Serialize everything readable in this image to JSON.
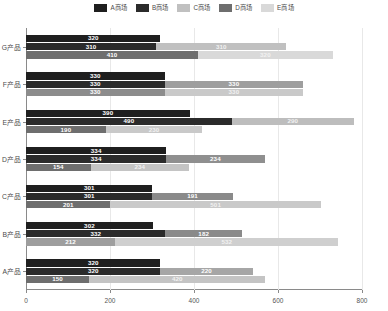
{
  "legend": {
    "position": "top-center",
    "items": [
      {
        "label": "A商场",
        "color": "#1f1f1f"
      },
      {
        "label": "B商场",
        "color": "#2b2b2b"
      },
      {
        "label": "C商场",
        "color": "#c0c0c0"
      },
      {
        "label": "D商场",
        "color": "#6e6e6e"
      },
      {
        "label": "E商场",
        "color": "#d9d9d9"
      }
    ]
  },
  "chart_data": {
    "type": "bar",
    "orientation": "horizontal",
    "stacked": true,
    "title": "",
    "xlabel": "",
    "ylabel": "",
    "xlim": [
      0,
      800
    ],
    "xticks": [
      0,
      200,
      400,
      600,
      800
    ],
    "grid": true,
    "categories": [
      "A产品",
      "B产品",
      "C产品",
      "D产品",
      "E产品",
      "F产品",
      "G产品"
    ],
    "series": [
      {
        "name": "A商场",
        "color": "#1f1f1f",
        "values": [
          320,
          302,
          301,
          334,
          390,
          330,
          320
        ]
      },
      {
        "name": "B商场",
        "color": "#2b2b2b",
        "values": [
          320,
          332,
          301,
          334,
          490,
          330,
          310
        ]
      },
      {
        "name": "C商场",
        "color": "#c0c0c0",
        "values": [
          220,
          182,
          191,
          234,
          290,
          330,
          310
        ]
      },
      {
        "name": "D商场",
        "color": "#6e6e6e",
        "values": [
          150,
          212,
          201,
          154,
          190,
          330,
          410
        ]
      },
      {
        "name": "E商场",
        "color": "#d9d9d9",
        "values": [
          420,
          532,
          501,
          234,
          230,
          330,
          320
        ]
      }
    ],
    "rows": [
      {
        "category": "G产品",
        "bars": [
          {
            "segments": [
              {
                "series": "A商场",
                "value": 320,
                "color": "#1f1f1f",
                "label": "320"
              }
            ]
          },
          {
            "segments": [
              {
                "series": "B商场",
                "value": 310,
                "color": "#2b2b2b",
                "label": "310"
              },
              {
                "series": "C商场",
                "value": 310,
                "color": "#c0c0c0",
                "label": "310"
              }
            ]
          },
          {
            "segments": [
              {
                "series": "D商场",
                "value": 410,
                "color": "#6e6e6e",
                "label": "410"
              },
              {
                "series": "E商场",
                "value": 320,
                "color": "#d9d9d9",
                "label": "320"
              }
            ]
          }
        ]
      },
      {
        "category": "F产品",
        "bars": [
          {
            "segments": [
              {
                "series": "A商场",
                "value": 330,
                "color": "#1f1f1f",
                "label": "330"
              }
            ]
          },
          {
            "segments": [
              {
                "series": "B商场",
                "value": 330,
                "color": "#2b2b2b",
                "label": "330"
              },
              {
                "series": "C商场",
                "value": 330,
                "color": "#9e9e9e",
                "label": "330"
              }
            ]
          },
          {
            "segments": [
              {
                "series": "D商场",
                "value": 330,
                "color": "#8c8c8c",
                "label": "330"
              },
              {
                "series": "E商场",
                "value": 330,
                "color": "#c9c9c9",
                "label": "330"
              }
            ]
          }
        ]
      },
      {
        "category": "E产品",
        "bars": [
          {
            "segments": [
              {
                "series": "A商场",
                "value": 390,
                "color": "#1f1f1f",
                "label": "390"
              }
            ]
          },
          {
            "segments": [
              {
                "series": "B商场",
                "value": 490,
                "color": "#2b2b2b",
                "label": "490"
              },
              {
                "series": "C商场",
                "value": 290,
                "color": "#bdbdbd",
                "label": "290"
              }
            ]
          },
          {
            "segments": [
              {
                "series": "D商场",
                "value": 190,
                "color": "#6e6e6e",
                "label": "190"
              },
              {
                "series": "E商场",
                "value": 230,
                "color": "#c9c9c9",
                "label": "230"
              }
            ]
          }
        ]
      },
      {
        "category": "D产品",
        "bars": [
          {
            "segments": [
              {
                "series": "A商场",
                "value": 334,
                "color": "#1f1f1f",
                "label": "334"
              }
            ]
          },
          {
            "segments": [
              {
                "series": "B商场",
                "value": 334,
                "color": "#2b2b2b",
                "label": "334"
              },
              {
                "series": "C商场",
                "value": 234,
                "color": "#8f8f8f",
                "label": "234"
              }
            ]
          },
          {
            "segments": [
              {
                "series": "D商场",
                "value": 154,
                "color": "#6e6e6e",
                "label": "154"
              },
              {
                "series": "E商场",
                "value": 234,
                "color": "#c4c4c4",
                "label": "234"
              }
            ]
          }
        ]
      },
      {
        "category": "C产品",
        "bars": [
          {
            "segments": [
              {
                "series": "A商场",
                "value": 301,
                "color": "#1f1f1f",
                "label": "301"
              }
            ]
          },
          {
            "segments": [
              {
                "series": "B商场",
                "value": 301,
                "color": "#2b2b2b",
                "label": "301"
              },
              {
                "series": "C商场",
                "value": 191,
                "color": "#8a8a8a",
                "label": "191"
              }
            ]
          },
          {
            "segments": [
              {
                "series": "D商场",
                "value": 201,
                "color": "#6e6e6e",
                "label": "201"
              },
              {
                "series": "E商场",
                "value": 501,
                "color": "#c9c9c9",
                "label": "501"
              }
            ]
          }
        ]
      },
      {
        "category": "B产品",
        "bars": [
          {
            "segments": [
              {
                "series": "A商场",
                "value": 302,
                "color": "#1f1f1f",
                "label": "302"
              }
            ]
          },
          {
            "segments": [
              {
                "series": "B商场",
                "value": 332,
                "color": "#2b2b2b",
                "label": "332"
              },
              {
                "series": "C商场",
                "value": 182,
                "color": "#8a8a8a",
                "label": "182"
              }
            ]
          },
          {
            "segments": [
              {
                "series": "D商场",
                "value": 212,
                "color": "#9e9e9e",
                "label": "212"
              },
              {
                "series": "E商场",
                "value": 532,
                "color": "#cfcfcf",
                "label": "532"
              }
            ]
          }
        ]
      },
      {
        "category": "A产品",
        "bars": [
          {
            "segments": [
              {
                "series": "A商场",
                "value": 320,
                "color": "#1f1f1f",
                "label": "320"
              }
            ]
          },
          {
            "segments": [
              {
                "series": "B商场",
                "value": 320,
                "color": "#2b2b2b",
                "label": "320"
              },
              {
                "series": "C商场",
                "value": 220,
                "color": "#a6a6a6",
                "label": "220"
              }
            ]
          },
          {
            "segments": [
              {
                "series": "D商场",
                "value": 150,
                "color": "#6e6e6e",
                "label": "150"
              },
              {
                "series": "E商场",
                "value": 420,
                "color": "#c4c4c4",
                "label": "420"
              }
            ]
          }
        ]
      }
    ]
  }
}
